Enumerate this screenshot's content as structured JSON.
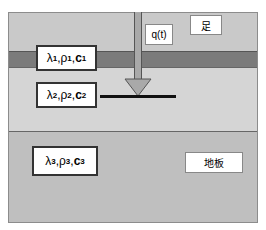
{
  "diagram": {
    "layers": [
      {
        "name": "top-layer",
        "color": "#c9c9c9"
      },
      {
        "name": "dark-band",
        "color": "#7b7b7b"
      },
      {
        "name": "middle-layer",
        "color": "#d5d5d5"
      },
      {
        "name": "bottom-layer",
        "color": "#bfbfbf"
      }
    ],
    "layer1_props": {
      "lambda": "λ",
      "rho": "ρ",
      "c": "c",
      "index": "1"
    },
    "layer2_props": {
      "lambda": "λ",
      "rho": "ρ",
      "c": "c",
      "index": "2"
    },
    "layer3_props": {
      "lambda": "λ",
      "rho": "ρ",
      "c": "c",
      "index": "3"
    },
    "heat_flux_label": "q(t)",
    "foot_label": "足",
    "floor_label": "地板",
    "comma": ","
  }
}
